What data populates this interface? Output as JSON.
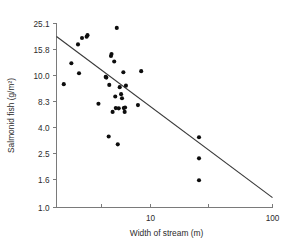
{
  "chart_data": {
    "type": "scatter",
    "title": "",
    "xlabel": "Width of stream (m)",
    "ylabel": "Salmonid fish (g/m²)",
    "x_scale": "log",
    "y_scale": "log",
    "xlim": [
      1.7,
      100
    ],
    "ylim": [
      1.0,
      25.1
    ],
    "grid": false,
    "legend": null,
    "x_ticks": [
      {
        "value": 1.7,
        "label": ""
      },
      {
        "value": 4,
        "label": ""
      },
      {
        "value": 10,
        "label": "10"
      },
      {
        "value": 30,
        "label": ""
      },
      {
        "value": 100,
        "label": "100"
      }
    ],
    "y_ticks": [
      {
        "value": 25.1,
        "label": "25.1"
      },
      {
        "value": 15.8,
        "label": "15.8"
      },
      {
        "value": 10.0,
        "label": "10.0"
      },
      {
        "value": 8.3,
        "label": "8.3"
      },
      {
        "value": 4.0,
        "label": "4.0"
      },
      {
        "value": 2.5,
        "label": "2.5"
      },
      {
        "value": 1.6,
        "label": "1.6"
      },
      {
        "value": 1.0,
        "label": "1.0"
      }
    ],
    "points": [
      {
        "x": 1.95,
        "y": 9.4
      },
      {
        "x": 2.25,
        "y": 12.4
      },
      {
        "x": 2.55,
        "y": 17.3
      },
      {
        "x": 2.6,
        "y": 10.4
      },
      {
        "x": 2.75,
        "y": 19.4
      },
      {
        "x": 3.0,
        "y": 19.8
      },
      {
        "x": 3.05,
        "y": 20.4
      },
      {
        "x": 3.75,
        "y": 7.8
      },
      {
        "x": 4.3,
        "y": 9.9
      },
      {
        "x": 4.35,
        "y": 9.85
      },
      {
        "x": 4.6,
        "y": 9.35
      },
      {
        "x": 4.75,
        "y": 14.1
      },
      {
        "x": 4.8,
        "y": 14.6
      },
      {
        "x": 4.55,
        "y": 3.4
      },
      {
        "x": 4.9,
        "y": 6.2
      },
      {
        "x": 5.05,
        "y": 12.8
      },
      {
        "x": 5.15,
        "y": 8.6
      },
      {
        "x": 5.2,
        "y": 6.9
      },
      {
        "x": 5.3,
        "y": 23.2
      },
      {
        "x": 5.4,
        "y": 2.95
      },
      {
        "x": 5.5,
        "y": 6.85
      },
      {
        "x": 5.6,
        "y": 9.2
      },
      {
        "x": 5.75,
        "y": 8.75
      },
      {
        "x": 5.85,
        "y": 8.5
      },
      {
        "x": 6.0,
        "y": 10.6
      },
      {
        "x": 6.05,
        "y": 6.9
      },
      {
        "x": 6.15,
        "y": 6.2
      },
      {
        "x": 6.2,
        "y": 7.0
      },
      {
        "x": 6.3,
        "y": 9.3
      },
      {
        "x": 8.4,
        "y": 10.8
      },
      {
        "x": 7.9,
        "y": 7.5
      },
      {
        "x": 25.0,
        "y": 3.35
      },
      {
        "x": 25.0,
        "y": 2.3
      },
      {
        "x": 25.0,
        "y": 1.58
      }
    ],
    "fit_line": {
      "style": "solid",
      "x_start": 1.7,
      "y_start": 19.9,
      "x_end": 100,
      "y_end": 1.18
    }
  }
}
